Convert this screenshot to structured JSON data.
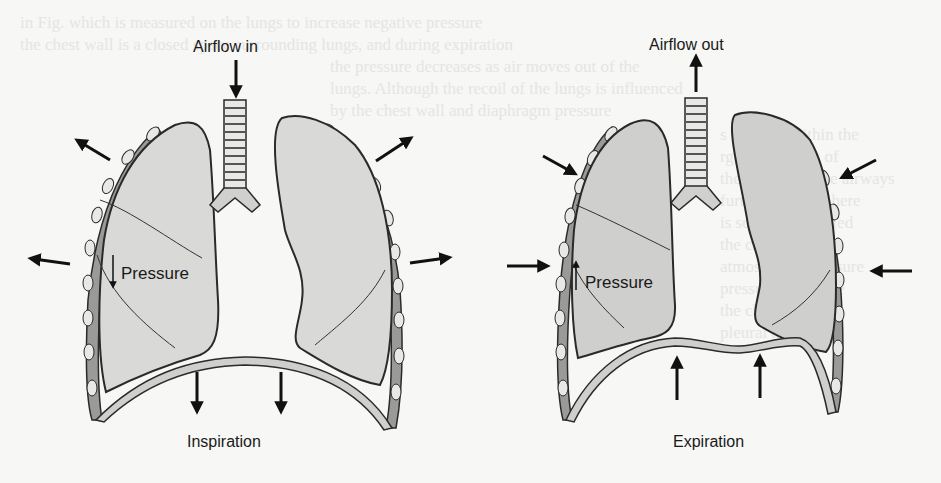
{
  "diagram": {
    "type": "anatomical breathing mechanics",
    "panels": [
      {
        "id": "inspiration",
        "caption": "Inspiration",
        "airflow_label": "Airflow in",
        "airflow_direction": "down",
        "pressure_label": "Pressure",
        "pressure_direction": "down",
        "chest_wall_arrows": "outward",
        "diaphragm_arrows": "down"
      },
      {
        "id": "expiration",
        "caption": "Expiration",
        "airflow_label": "Airflow out",
        "airflow_direction": "up",
        "pressure_label": "Pressure",
        "pressure_direction": "up",
        "chest_wall_arrows": "inward",
        "diaphragm_arrows": "up"
      }
    ],
    "colors": {
      "background": "#f7f7f5",
      "lung_fill_inspiration": "#d9d9d7",
      "lung_fill_expiration": "#cfcfcd",
      "outline": "#2a2a2a",
      "rib": "#9a9a98",
      "pleura": "#ececea"
    }
  }
}
